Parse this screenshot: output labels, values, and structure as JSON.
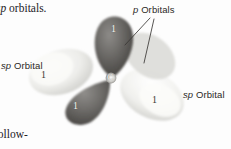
{
  "figure": {
    "background_color": "#fdfdfd"
  },
  "book_text": {
    "top_fragment_italic": "sp",
    "top_fragment_rest": " orbitals.",
    "bottom_fragment": "follow-"
  },
  "labels": {
    "sp_orbital_left": {
      "italic": "sp",
      "rest": " Orbital"
    },
    "sp_orbital_right": {
      "italic": "sp",
      "rest": " Orbital"
    },
    "p_orbitals": {
      "italic": "p",
      "rest": " Orbitals"
    }
  },
  "atom": {
    "symbol": "C",
    "color": "#f7f7f5"
  },
  "lobes": [
    {
      "name": "p-orbital-upper",
      "tag": "1",
      "shade": "dark",
      "fill": "#6f6d6a"
    },
    {
      "name": "p-orbital-lower-left",
      "tag": "1",
      "shade": "dark",
      "fill": "#706e6b"
    },
    {
      "name": "sp-orbital-lower-right",
      "tag": "1",
      "shade": "light",
      "fill": "#e7e7e4"
    },
    {
      "name": "sp-orbital-left",
      "tag": "1",
      "shade": "light",
      "fill": "#ececea"
    }
  ],
  "colors": {
    "dark_lobe": "#6f6d6a",
    "dark_lobe_core": "#4a4845",
    "light_lobe": "#e9e9e6",
    "light_lobe_core": "#ffffff",
    "text": "#23211f",
    "leader_line": "#3a3835"
  }
}
